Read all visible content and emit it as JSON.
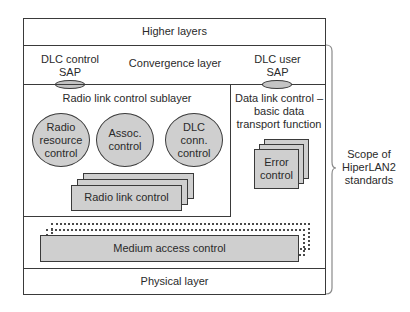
{
  "diagram": {
    "higher_layers": "Higher layers",
    "convergence_layer": "Convergence layer",
    "dlc_control_sap": {
      "line1": "DLC control",
      "line2": "SAP"
    },
    "dlc_user_sap": {
      "line1": "DLC user",
      "line2": "SAP"
    },
    "rlc_sublayer": {
      "title": "Radio link control sublayer",
      "functions": [
        {
          "line1": "Radio",
          "line2": "resource",
          "line3": "control"
        },
        {
          "line1": "Assoc.",
          "line2": "control"
        },
        {
          "line1": "DLC",
          "line2": "conn.",
          "line3": "control"
        }
      ],
      "stack_label": "Radio link control"
    },
    "data_link_control": {
      "line1": "Data link control –",
      "line2": "basic data",
      "line3": "transport function",
      "stack_label": {
        "line1": "Error",
        "line2": "control"
      }
    },
    "mac": "Medium access control",
    "physical_layer": "Physical layer",
    "scope": {
      "line1": "Scope of",
      "line2": "HiperLAN2",
      "line3": "standards"
    }
  }
}
